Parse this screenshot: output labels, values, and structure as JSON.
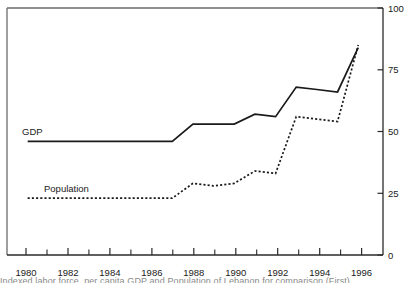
{
  "chart_data": {
    "type": "line",
    "title": "",
    "subtitle": "",
    "xlabel": "",
    "ylabel": "",
    "xlim": [
      1979.0,
      1997.2
    ],
    "ylim": [
      0,
      100
    ],
    "grid": false,
    "legend_position": "inline-labels",
    "y_ticks": [
      0,
      25,
      50,
      75,
      100
    ],
    "y_tick_labels": [
      "0",
      "25",
      "50",
      "75",
      "100"
    ],
    "y_axis_side": "right",
    "x_major_ticks": [
      1980,
      1982,
      1984,
      1986,
      1988,
      1990,
      1992,
      1994,
      1996
    ],
    "x_major_tick_labels": [
      "1980",
      "1982",
      "1984",
      "1986",
      "1988",
      "1990",
      "1992",
      "1994",
      "1996"
    ],
    "x_minor_ticks": [
      1981,
      1983,
      1985,
      1987,
      1989,
      1991,
      1993,
      1995
    ],
    "x": [
      1980,
      1981,
      1982,
      1983,
      1984,
      1985,
      1986,
      1987,
      1988,
      1989,
      1990,
      1991,
      1992,
      1993,
      1994,
      1995,
      1996
    ],
    "series": [
      {
        "name": "GDP",
        "style": "solid",
        "color": "#1a1a1a",
        "label_text": "GDP",
        "values": [
          46,
          46,
          46,
          46,
          46,
          46,
          46,
          46,
          53,
          53,
          53,
          57,
          56,
          68,
          67,
          66,
          84
        ]
      },
      {
        "name": "Population",
        "style": "dotted",
        "color": "#1a1a1a",
        "label_text": "Population",
        "values": [
          23,
          23,
          23,
          23,
          23,
          23,
          23,
          23,
          29,
          28,
          29,
          34,
          33,
          56,
          55,
          54,
          85
        ]
      }
    ]
  },
  "labels": {
    "gdp": "GDP",
    "population": "Population"
  },
  "caption": {
    "cropped_footer_text": "Indexed labor force, per capita GDP and Population of Lebanon for comparison (First)"
  }
}
